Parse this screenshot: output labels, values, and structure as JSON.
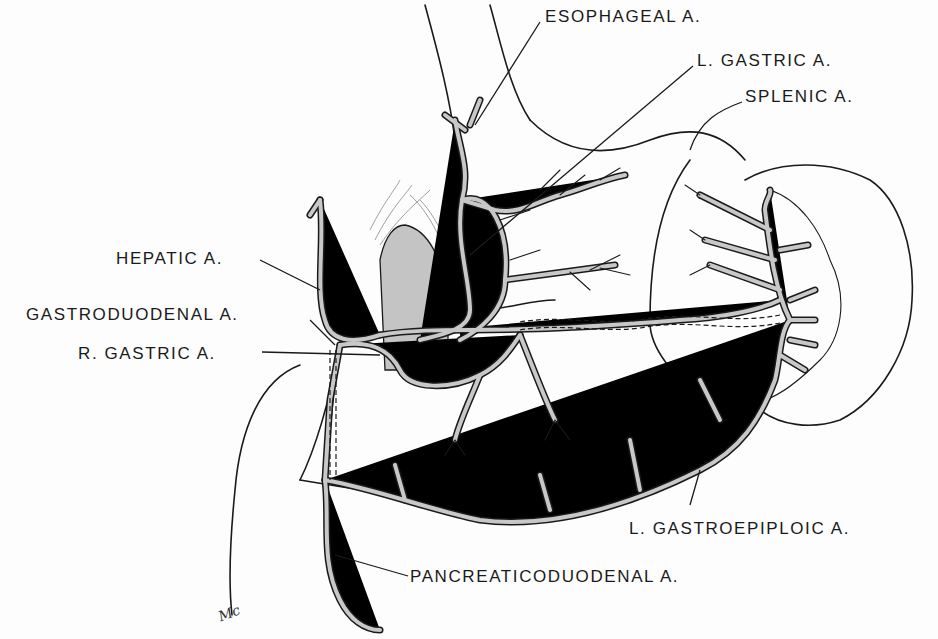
{
  "figure": {
    "colors": {
      "ink": "#1a1a1a",
      "vessel_fill": "#c8c8c8",
      "shade": "#c4c4c4",
      "background": "#fdfdfd"
    },
    "signature": "Mc"
  },
  "labels": [
    {
      "id": "esophageal",
      "text": "ESOPHAGEAL A.",
      "x": 545,
      "y": 8
    },
    {
      "id": "l-gastric",
      "text": "L. GASTRIC A.",
      "x": 697,
      "y": 52
    },
    {
      "id": "splenic",
      "text": "SPLENIC A.",
      "x": 745,
      "y": 88
    },
    {
      "id": "hepatic",
      "text": "HEPATIC A.",
      "x": 116,
      "y": 250
    },
    {
      "id": "gastroduodenal",
      "text": "GASTRODUODENAL A.",
      "x": 26,
      "y": 306
    },
    {
      "id": "r-gastric",
      "text": "R. GASTRIC A.",
      "x": 78,
      "y": 345
    },
    {
      "id": "l-gastroepiploic",
      "text": "L. GASTROEPIPLOIC A.",
      "x": 629,
      "y": 520
    },
    {
      "id": "pancreaticoduodenal",
      "text": "PANCREATICODUODENAL A.",
      "x": 410,
      "y": 568
    }
  ]
}
